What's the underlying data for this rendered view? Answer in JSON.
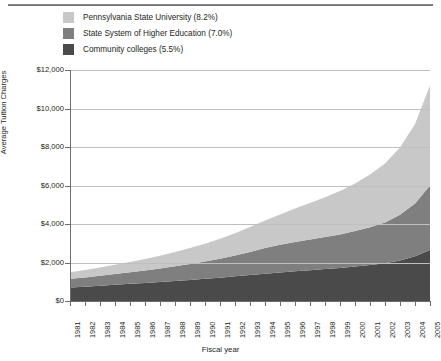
{
  "chart_data": {
    "type": "area",
    "stacked": true,
    "title": "",
    "xlabel": "Fiscal year",
    "ylabel": "Average Tuition Charges",
    "xlim": [
      1981,
      2005
    ],
    "ylim": [
      0,
      12000
    ],
    "ytick_values": [
      0,
      2000,
      4000,
      6000,
      8000,
      10000,
      12000
    ],
    "ytick_labels": [
      "$0",
      "$2,000",
      "$4,000",
      "$6,000",
      "$8,000",
      "$10,000",
      "$12,000"
    ],
    "grid": true,
    "legend_position": "top-left",
    "categories": [
      1981,
      1982,
      1983,
      1984,
      1985,
      1986,
      1987,
      1988,
      1989,
      1990,
      1991,
      1992,
      1993,
      1994,
      1995,
      1996,
      1997,
      1998,
      1999,
      2000,
      2001,
      2002,
      2003,
      2004,
      2005
    ],
    "xtick_labels": [
      "1981",
      "1982",
      "1983",
      "1984",
      "1985",
      "1986",
      "1987",
      "1988",
      "1989",
      "1990",
      "1991",
      "1992",
      "1993",
      "1994",
      "1995",
      "1996",
      "1997",
      "1998",
      "1999",
      "2000",
      "2001",
      "2002",
      "2003",
      "2004",
      "2005"
    ],
    "series": [
      {
        "name": "Community colleges (5.5%)",
        "label": "Community colleges",
        "growth_rate": "5.5%",
        "color": "#4a4a4a",
        "values": [
          700,
          740,
          790,
          840,
          890,
          940,
          990,
          1040,
          1090,
          1150,
          1210,
          1280,
          1350,
          1420,
          1480,
          1540,
          1600,
          1660,
          1720,
          1790,
          1870,
          1960,
          2110,
          2320,
          2650
        ]
      },
      {
        "name": "State System of Higher Education (7.0%)",
        "label": "State System of Higher Education",
        "growth_rate": "7.0%",
        "color": "#7f7f7f",
        "values": [
          450,
          480,
          520,
          560,
          600,
          650,
          700,
          760,
          830,
          900,
          980,
          1080,
          1200,
          1330,
          1440,
          1520,
          1590,
          1660,
          1740,
          1840,
          1960,
          2120,
          2370,
          2750,
          3350
        ]
      },
      {
        "name": "Pennsylvania State University (8.2%)",
        "label": "Pennsylvania State University",
        "growth_rate": "8.2%",
        "color": "#c8c8c8",
        "values": [
          350,
          390,
          430,
          480,
          530,
          590,
          660,
          740,
          830,
          930,
          1040,
          1160,
          1290,
          1430,
          1580,
          1740,
          1900,
          2070,
          2260,
          2480,
          2740,
          3060,
          3500,
          4130,
          5200
        ]
      }
    ],
    "totals": [
      1500,
      1610,
      1740,
      1880,
      2020,
      2180,
      2350,
      2540,
      2750,
      2980,
      3230,
      3520,
      3840,
      4180,
      4500,
      4800,
      5090,
      5390,
      5720,
      6110,
      6570,
      7140,
      7980,
      9200,
      11200
    ]
  },
  "legend": {
    "items": [
      {
        "label": "Pennsylvania State University (8.2%)",
        "color": "#c8c8c8",
        "swatch_name": "legend-swatch-psu"
      },
      {
        "label": "State System of Higher Education (7.0%)",
        "color": "#7f7f7f",
        "swatch_name": "legend-swatch-sshe"
      },
      {
        "label": "Community colleges (5.5%)",
        "color": "#4a4a4a",
        "swatch_name": "legend-swatch-cc"
      }
    ]
  },
  "axes": {
    "y_title": "Average Tuition Charges",
    "x_title": "Fiscal year"
  },
  "colors": {
    "light": "#c8c8c8",
    "medium": "#7f7f7f",
    "dark": "#4a4a4a",
    "axis": "#6e6e6e",
    "grid": "#bfbfbf",
    "text": "#231f20",
    "background": "#ffffff"
  }
}
